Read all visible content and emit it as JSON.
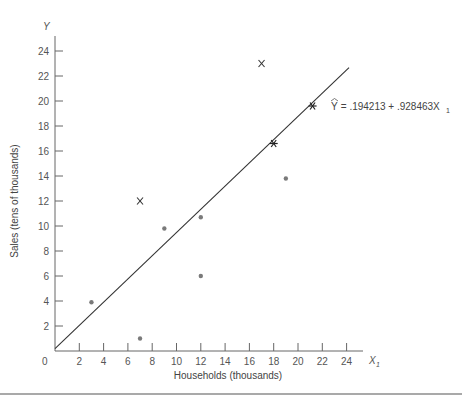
{
  "chart_data": {
    "type": "scatter",
    "title": "",
    "xlabel": "Households (thousands)",
    "ylabel": "Sales (tens of thousands)",
    "x_axis_var": "X",
    "x_axis_var_sub": "1",
    "y_axis_var": "Y",
    "xlim": [
      0,
      25
    ],
    "ylim": [
      0,
      25
    ],
    "x_ticks": [
      2,
      4,
      6,
      8,
      10,
      12,
      14,
      16,
      18,
      20,
      22,
      24
    ],
    "y_ticks": [
      2,
      4,
      6,
      8,
      10,
      12,
      14,
      16,
      18,
      20,
      22,
      24
    ],
    "origin_label": "0",
    "grid": false,
    "series": [
      {
        "name": "observations",
        "marker": "dot",
        "points": [
          {
            "x": 3,
            "y": 3.9
          },
          {
            "x": 7,
            "y": 1.0
          },
          {
            "x": 9,
            "y": 9.8
          },
          {
            "x": 12,
            "y": 10.7
          },
          {
            "x": 12,
            "y": 6.0
          },
          {
            "x": 19,
            "y": 13.8
          }
        ]
      },
      {
        "name": "x-marked points",
        "marker": "x",
        "points": [
          {
            "x": 7,
            "y": 12
          },
          {
            "x": 17,
            "y": 23
          }
        ]
      },
      {
        "name": "star points on line",
        "marker": "star",
        "points": [
          {
            "x": 18,
            "y": 16.6
          },
          {
            "x": 21.2,
            "y": 19.6
          }
        ]
      }
    ],
    "regression_line": {
      "intercept": 0.194213,
      "slope": 0.928463,
      "x_start": 0,
      "x_end": 24.2,
      "equation_label": {
        "yhat": "Y",
        "eq": " = .194213 + .928463X",
        "sub": "1"
      }
    }
  }
}
